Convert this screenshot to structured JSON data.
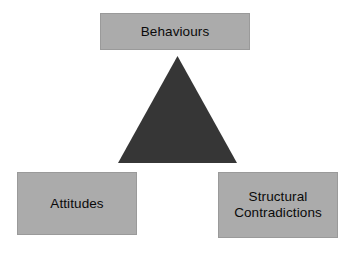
{
  "diagram": {
    "background_color": "#ffffff",
    "box_fill_color": "#ababab",
    "box_border_color": "#9a9a9a",
    "triangle_color": "#363636",
    "text_color": "#0a0a0a",
    "nodes": [
      {
        "id": "behaviours",
        "label": "Behaviours",
        "position": "top"
      },
      {
        "id": "attitudes",
        "label": "Attitudes",
        "position": "bottom-left"
      },
      {
        "id": "structural-contradictions",
        "label": "Structural\nContradictions",
        "position": "bottom-right"
      }
    ],
    "center_shape": {
      "id": "center-triangle",
      "type": "triangle",
      "fill": "#363636"
    }
  }
}
